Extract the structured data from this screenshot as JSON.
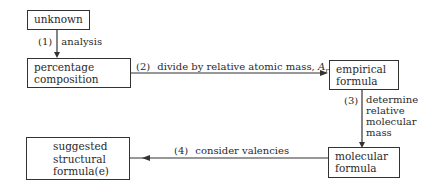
{
  "nodes": {
    "unknown": {
      "line1": "unknown"
    },
    "percentage": {
      "line1": "percentage",
      "line2": "composition"
    },
    "empirical": {
      "line1": "empirical",
      "line2": "formula"
    },
    "molecular": {
      "line1": "molecular",
      "line2": "formula"
    },
    "structural": {
      "line1": "suggested",
      "line2": "structural",
      "line3": "formula(e)"
    }
  },
  "steps": {
    "s1": {
      "num": "(1)",
      "text": "analysis"
    },
    "s2": {
      "num": "(2)",
      "text": "divide by relative atomic mass,",
      "symbol": "A",
      "sub": "r"
    },
    "s3": {
      "num": "(3)",
      "line1": "determine",
      "line2": "relative",
      "line3": "molecular",
      "line4": "mass"
    },
    "s4": {
      "num": "(4)",
      "text": "consider valencies"
    }
  }
}
